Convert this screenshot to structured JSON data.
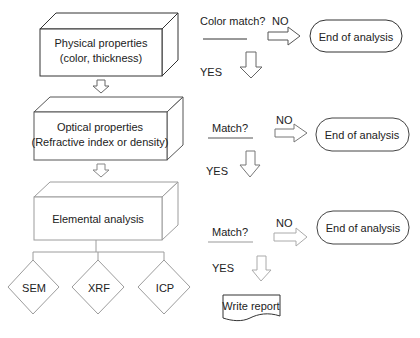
{
  "stages": [
    {
      "line1": "Physical properties",
      "line2": "(color, thickness)"
    },
    {
      "line1": "Optical properties",
      "line2": "(Refractive index or density)"
    },
    {
      "line1": "Elemental analysis"
    }
  ],
  "decisions": [
    {
      "question": "Color match?",
      "no": "NO",
      "yes": "YES",
      "end": "End of analysis"
    },
    {
      "question": "Match?",
      "no": "NO",
      "yes": "YES",
      "end": "End of analysis"
    },
    {
      "question": "Match?",
      "no": "NO",
      "yes": "YES",
      "end": "End of analysis"
    }
  ],
  "techniques": [
    "SEM",
    "XRF",
    "ICP"
  ],
  "final": {
    "label": "Write report"
  },
  "colors": {
    "dark_line": "#333333",
    "gray_line": "#8a8a8a",
    "light_line": "#9c9c9c"
  }
}
